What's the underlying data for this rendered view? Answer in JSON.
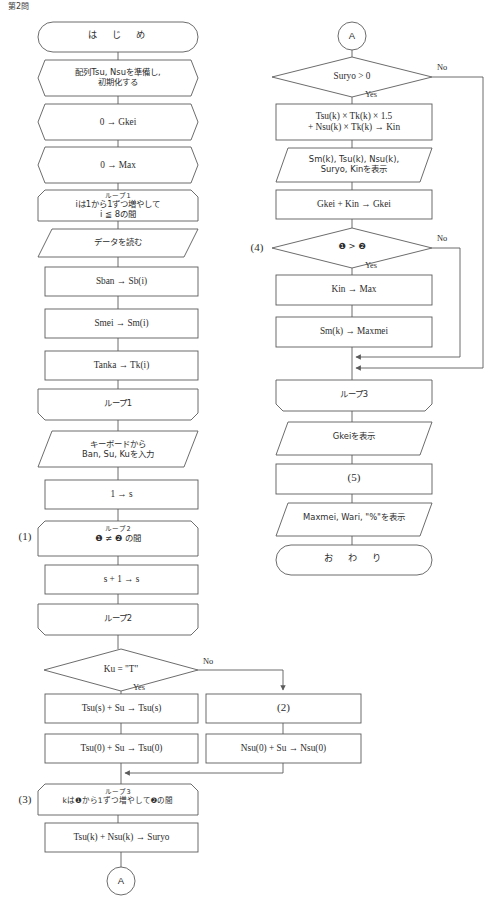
{
  "page": {
    "header": "第2問",
    "background": "#ffffff",
    "stroke_color": "#5b5b5b",
    "text_color": "#2d2d2d",
    "width": 501,
    "height": 917
  },
  "labels": {
    "q1": "(1)",
    "q3": "(3)",
    "q4": "(4)"
  },
  "connectors": {
    "a_bottom": "A",
    "a_top": "A"
  },
  "edge_labels": {
    "ku_no": "No",
    "ku_yes": "Yes",
    "suryo_no": "No",
    "suryo_yes": "Yes",
    "cmp_no": "No",
    "cmp_yes": "Yes"
  },
  "left_column": [
    {
      "id": "start",
      "shape": "terminator",
      "text": "は　じ　め"
    },
    {
      "id": "prep-init",
      "shape": "hexagon",
      "text": "配列Tsu, Nsuを準備し,\n初期化する"
    },
    {
      "id": "prep-gkei",
      "shape": "hexagon",
      "text": "0 → Gkei"
    },
    {
      "id": "prep-max",
      "shape": "hexagon",
      "text": "0 → Max"
    },
    {
      "id": "loop1-start",
      "shape": "loop-start",
      "caption": "ループ1",
      "text": "iは1から1ずつ増やして\ni ≦ 8の間"
    },
    {
      "id": "read-data",
      "shape": "parallelogram",
      "text": "データを読む"
    },
    {
      "id": "sban",
      "shape": "process",
      "text": "Sban → Sb(i)"
    },
    {
      "id": "smei",
      "shape": "process",
      "text": "Smei → Sm(i)"
    },
    {
      "id": "tanka",
      "shape": "process",
      "text": "Tanka → Tk(i)"
    },
    {
      "id": "loop1-end",
      "shape": "loop-end",
      "text": "ループ1"
    },
    {
      "id": "keyboard",
      "shape": "parallelogram",
      "text": "キーボードから\nBan, Su, Kuを入力"
    },
    {
      "id": "s-init",
      "shape": "process",
      "text": "1 → s"
    },
    {
      "id": "loop2-start",
      "shape": "loop-start",
      "caption": "ループ2",
      "text": "❶ ≠ ❷ の間"
    },
    {
      "id": "s-inc",
      "shape": "process",
      "text": "s + 1 → s"
    },
    {
      "id": "loop2-end",
      "shape": "loop-end",
      "text": "ループ2"
    },
    {
      "id": "ku-decision",
      "shape": "decision",
      "text": "Ku = \"T\""
    },
    {
      "id": "tsu-s",
      "shape": "process",
      "text": "Tsu(s) + Su → Tsu(s)"
    },
    {
      "id": "tsu-0",
      "shape": "process",
      "text": "Tsu(0) + Su → Tsu(0)"
    },
    {
      "id": "blank-2",
      "shape": "process",
      "text": "(2)"
    },
    {
      "id": "nsu-0",
      "shape": "process",
      "text": "Nsu(0) + Su → Nsu(0)"
    },
    {
      "id": "loop3-start",
      "shape": "loop-start",
      "caption": "ループ3",
      "text": "kは❶から1ずつ増やして❷の間"
    },
    {
      "id": "suryo-calc",
      "shape": "process",
      "text": "Tsu(k) + Nsu(k) → Suryo"
    }
  ],
  "right_column": [
    {
      "id": "suryo-decision",
      "shape": "decision",
      "text": "Suryo > 0"
    },
    {
      "id": "kin-calc",
      "shape": "process",
      "text": "Tsu(k) × Tk(k) × 1.5\n+ Nsu(k) × Tk(k) → Kin"
    },
    {
      "id": "display-row",
      "shape": "parallelogram",
      "text": "Sm(k), Tsu(k), Nsu(k),\nSuryo, Kinを表示"
    },
    {
      "id": "gkei-acc",
      "shape": "process",
      "text": "Gkei + Kin → Gkei"
    },
    {
      "id": "cmp-decision",
      "shape": "decision",
      "text": "❶ > ❷"
    },
    {
      "id": "kin-max",
      "shape": "process",
      "text": "Kin → Max"
    },
    {
      "id": "smk-maxmei",
      "shape": "process",
      "text": "Sm(k) → Maxmei"
    },
    {
      "id": "loop3-end",
      "shape": "loop-end",
      "text": "ループ3"
    },
    {
      "id": "gkei-display",
      "shape": "parallelogram",
      "text": "Gkeiを表示"
    },
    {
      "id": "blank-5",
      "shape": "process",
      "text": "(5)"
    },
    {
      "id": "final-display",
      "shape": "parallelogram",
      "text": "Maxmei, Wari, \"%\"を表示"
    },
    {
      "id": "end",
      "shape": "terminator",
      "text": "お　わ　り"
    }
  ]
}
